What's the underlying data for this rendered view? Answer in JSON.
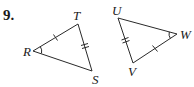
{
  "problem_number": "9.",
  "colors": {
    "stroke": "#2a2a2a",
    "text": "#1a1a1a",
    "background": "#ffffff"
  },
  "triangles": [
    {
      "name": "triangle-RTS",
      "vertices": [
        {
          "label": "R",
          "x": 33,
          "y": 51
        },
        {
          "label": "T",
          "x": 78,
          "y": 24
        },
        {
          "label": "S",
          "x": 92,
          "y": 71
        }
      ],
      "marks": {
        "RT": "single-tick",
        "TS": "double-tick",
        "angle_R": "arc"
      }
    },
    {
      "name": "triangle-UVW",
      "vertices": [
        {
          "label": "U",
          "x": 118,
          "y": 18
        },
        {
          "label": "V",
          "x": 133,
          "y": 63
        },
        {
          "label": "W",
          "x": 177,
          "y": 34
        }
      ],
      "marks": {
        "UV": "double-tick",
        "VW": "single-tick",
        "angle_W": "arc"
      }
    }
  ],
  "labels": {
    "R": "R",
    "T": "T",
    "S": "S",
    "U": "U",
    "V": "V",
    "W": "W"
  }
}
